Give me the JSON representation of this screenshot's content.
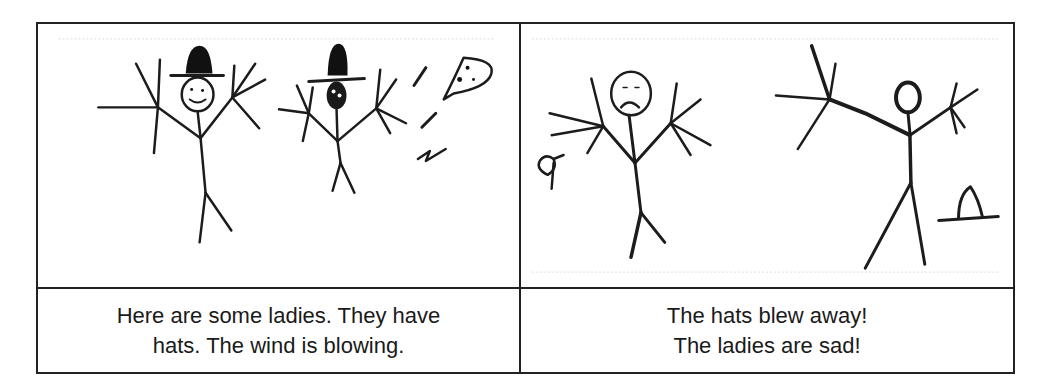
{
  "comic": {
    "panels": [
      {
        "id": "panel-1",
        "illustration": "two stick-figure ladies wearing black hats with wind blowing",
        "caption_lines": [
          "Here are some ladies. They have",
          "hats. The wind is blowing."
        ]
      },
      {
        "id": "panel-2",
        "illustration": "two sad stick-figure ladies without hats; hats lying on ground",
        "caption_lines": [
          "The hats blew away!",
          "The ladies are sad!"
        ]
      }
    ]
  },
  "colors": {
    "ink": "#1c1c1c",
    "border": "#222222",
    "background": "#ffffff"
  }
}
